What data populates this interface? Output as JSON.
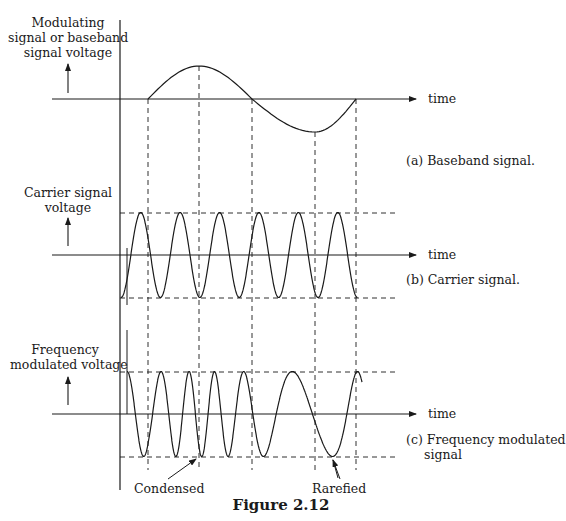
{
  "figure": {
    "caption": "Figure 2.12"
  },
  "panels": [
    {
      "id": "a",
      "ylabel_lines": [
        "Modulating",
        "signal or baseband",
        "signal voltage"
      ],
      "xlabel": "time",
      "caption": "(a) Baseband signal.",
      "waveform": "baseband"
    },
    {
      "id": "b",
      "ylabel_lines": [
        "Carrier signal",
        "voltage"
      ],
      "xlabel": "time",
      "caption": "(b) Carrier signal.",
      "waveform": "carrier"
    },
    {
      "id": "c",
      "ylabel_lines": [
        "Frequency",
        "modulated voltage"
      ],
      "xlabel": "time",
      "caption_lines": [
        "(c) Frequency modulated",
        "signal"
      ],
      "waveform": "fm"
    }
  ],
  "annotations": {
    "condensed": "Condensed",
    "rarefied": "Rarefied"
  },
  "chart_data": {
    "type": "line",
    "title": "Figure 2.12",
    "series": [
      {
        "name": "Baseband signal",
        "x_keypoints": [
          0,
          0.25,
          0.5,
          0.8,
          1.0
        ],
        "y_keypoints": [
          0,
          1,
          0,
          -1,
          0
        ]
      },
      {
        "name": "Carrier signal",
        "description": "Constant-frequency sinusoid, approx. 6 cycles over interval, constant amplitude",
        "cycles": 6,
        "amplitude": 1
      },
      {
        "name": "Frequency modulated signal",
        "description": "Constant amplitude; frequency increases when baseband positive (condensed) and decreases when baseband negative (rarefied)",
        "amplitude": 1
      }
    ],
    "xlabel": "time",
    "grid": false,
    "dashed_reference_lines": "vertical at baseband zero-crossings and extrema; horizontal at carrier/FM peak amplitudes"
  }
}
